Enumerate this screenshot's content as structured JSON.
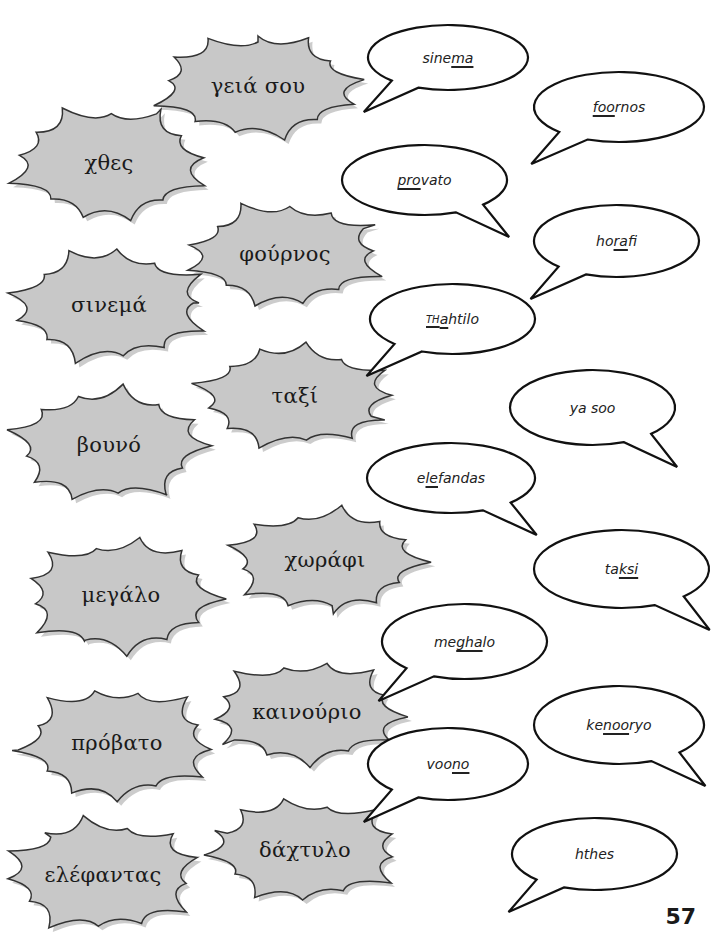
{
  "greek_words": [
    {
      "id": "geia-sou",
      "text": "γειά σου",
      "x": 158,
      "y": 36,
      "w": 200,
      "h": 100
    },
    {
      "id": "chthes",
      "text": "χθες",
      "x": 14,
      "y": 108,
      "w": 190,
      "h": 110
    },
    {
      "id": "fournos",
      "text": "φούρνος",
      "x": 190,
      "y": 204,
      "w": 190,
      "h": 100
    },
    {
      "id": "sinema",
      "text": "σινεμά",
      "x": 14,
      "y": 250,
      "w": 190,
      "h": 110
    },
    {
      "id": "taxi",
      "text": "ταξί",
      "x": 200,
      "y": 346,
      "w": 190,
      "h": 100
    },
    {
      "id": "vouno",
      "text": "βουνό",
      "x": 14,
      "y": 390,
      "w": 190,
      "h": 110
    },
    {
      "id": "chorafi",
      "text": "χωράφι",
      "x": 230,
      "y": 510,
      "w": 190,
      "h": 100
    },
    {
      "id": "megalo",
      "text": "μεγάλο",
      "x": 26,
      "y": 540,
      "w": 190,
      "h": 110
    },
    {
      "id": "kainourio",
      "text": "καινούριο",
      "x": 212,
      "y": 662,
      "w": 190,
      "h": 100
    },
    {
      "id": "provato",
      "text": "πρόβατο",
      "x": 22,
      "y": 688,
      "w": 190,
      "h": 110
    },
    {
      "id": "dachtylo",
      "text": "δάχτυλο",
      "x": 210,
      "y": 800,
      "w": 190,
      "h": 100
    },
    {
      "id": "elefantas",
      "text": "ελέφαντας",
      "x": 8,
      "y": 820,
      "w": 190,
      "h": 110
    }
  ],
  "transliterations": [
    {
      "id": "sinema",
      "parts": [
        {
          "t": "sine",
          "u": false
        },
        {
          "t": "ma",
          "u": true
        }
      ],
      "x": 368,
      "y": 25,
      "w": 160,
      "h": 65,
      "tail": "bl"
    },
    {
      "id": "foornos",
      "parts": [
        {
          "t": "foo",
          "u": true
        },
        {
          "t": "rnos",
          "u": false
        }
      ],
      "x": 534,
      "y": 72,
      "w": 170,
      "h": 70,
      "tail": "bl"
    },
    {
      "id": "provato",
      "parts": [
        {
          "t": "pro",
          "u": true
        },
        {
          "t": "vato",
          "u": false
        }
      ],
      "x": 342,
      "y": 145,
      "w": 165,
      "h": 70,
      "tail": "br"
    },
    {
      "id": "horafi",
      "parts": [
        {
          "t": "ho",
          "u": false
        },
        {
          "t": "ra",
          "u": true
        },
        {
          "t": "fi",
          "u": false
        }
      ],
      "x": 534,
      "y": 205,
      "w": 165,
      "h": 72,
      "tail": "bl"
    },
    {
      "id": "thahtilo",
      "parts": [
        {
          "t": "TH",
          "u": true,
          "sc": true
        },
        {
          "t": "a",
          "u": true
        },
        {
          "t": "htilo",
          "u": false
        }
      ],
      "x": 370,
      "y": 284,
      "w": 165,
      "h": 70,
      "tail": "bl"
    },
    {
      "id": "ya-soo",
      "parts": [
        {
          "t": "ya soo",
          "u": false
        }
      ],
      "x": 510,
      "y": 370,
      "w": 165,
      "h": 75,
      "tail": "br"
    },
    {
      "id": "elefandas",
      "parts": [
        {
          "t": "e",
          "u": false
        },
        {
          "t": "le",
          "u": true
        },
        {
          "t": "fandas",
          "u": false
        }
      ],
      "x": 367,
      "y": 443,
      "w": 168,
      "h": 70,
      "tail": "br"
    },
    {
      "id": "taksi",
      "parts": [
        {
          "t": "ta",
          "u": false
        },
        {
          "t": "ksi",
          "u": true
        }
      ],
      "x": 534,
      "y": 530,
      "w": 175,
      "h": 78,
      "tail": "br"
    },
    {
      "id": "meghalo",
      "parts": [
        {
          "t": "me",
          "u": false
        },
        {
          "t": "gha",
          "u": true
        },
        {
          "t": "lo",
          "u": false
        }
      ],
      "x": 382,
      "y": 604,
      "w": 165,
      "h": 75,
      "tail": "bl"
    },
    {
      "id": "kenooryo",
      "parts": [
        {
          "t": "ke",
          "u": false
        },
        {
          "t": "noo",
          "u": true
        },
        {
          "t": "ryo",
          "u": false
        }
      ],
      "x": 534,
      "y": 686,
      "w": 170,
      "h": 78,
      "tail": "br"
    },
    {
      "id": "voono",
      "parts": [
        {
          "t": "voo",
          "u": false
        },
        {
          "t": "no",
          "u": true
        }
      ],
      "x": 368,
      "y": 728,
      "w": 160,
      "h": 72,
      "tail": "bl"
    },
    {
      "id": "hthes",
      "parts": [
        {
          "t": "hthes",
          "u": false
        }
      ],
      "x": 512,
      "y": 818,
      "w": 165,
      "h": 72,
      "tail": "bl"
    }
  ],
  "page": {
    "number": "57"
  },
  "colors": {
    "burst_fill": "#c8c8c8",
    "burst_stroke": "#333333",
    "burst_shadow": "#9a9a9a",
    "bubble_stroke": "#111111"
  }
}
